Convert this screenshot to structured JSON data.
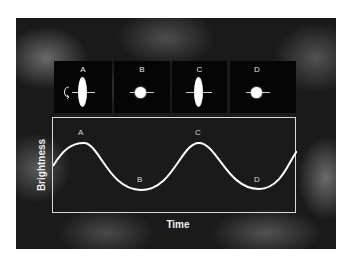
{
  "diagram": {
    "panels": [
      {
        "label": "A",
        "shape": "edge-on-elongated",
        "has_rotation_arrow": true
      },
      {
        "label": "B",
        "shape": "end-on-round"
      },
      {
        "label": "C",
        "shape": "edge-on-elongated"
      },
      {
        "label": "D",
        "shape": "end-on-round"
      }
    ],
    "graph": {
      "ylabel": "Brightness",
      "xlabel": "Time",
      "curve": "sinusoidal light curve",
      "points": [
        {
          "label": "A",
          "position": "peak"
        },
        {
          "label": "B",
          "position": "trough"
        },
        {
          "label": "C",
          "position": "peak"
        },
        {
          "label": "D",
          "position": "trough"
        }
      ]
    },
    "colors": {
      "background": "#1a1a1a",
      "panel": "#050505",
      "curve": "#ffffff",
      "frame": "#d8d8d8"
    }
  }
}
